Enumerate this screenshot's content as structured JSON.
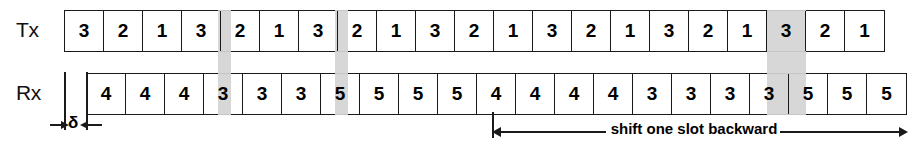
{
  "diagram": {
    "colors": {
      "band": "#d4d4d4",
      "stroke": "#1a1a1a",
      "text": "#000000",
      "background": "#ffffff"
    }
  },
  "rows": {
    "tx": {
      "label": "Tx",
      "slots": [
        "3",
        "2",
        "1",
        "3",
        "2",
        "1",
        "3",
        "2",
        "1",
        "3",
        "2",
        "1",
        "3",
        "2",
        "1",
        "3",
        "2",
        "1",
        "3",
        "2",
        "1"
      ]
    },
    "rx": {
      "label": "Rx",
      "slots": [
        "4",
        "4",
        "4",
        "3",
        "3",
        "3",
        "5",
        "5",
        "5",
        "5",
        "4",
        "4",
        "4",
        "4",
        "3",
        "3",
        "3",
        "3",
        "5",
        "5",
        "5"
      ]
    }
  },
  "bands": [
    {
      "name": "band-1",
      "left": 218,
      "top": 10,
      "width": 13,
      "height": 105
    },
    {
      "name": "band-2",
      "left": 335,
      "top": 10,
      "width": 13,
      "height": 105
    },
    {
      "name": "band-3",
      "left": 767,
      "top": 10,
      "width": 39,
      "height": 105
    }
  ],
  "annotations": {
    "delta": {
      "label": "δ",
      "meaning": "propagation offset between Tx and Rx frames"
    },
    "shift": {
      "label": "shift one slot backward"
    }
  }
}
